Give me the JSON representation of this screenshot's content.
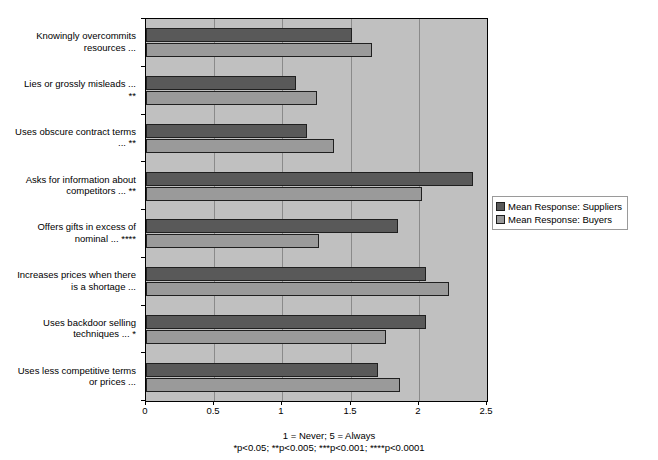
{
  "chart_data": {
    "type": "bar",
    "orientation": "horizontal",
    "title": "",
    "xlabel": "",
    "ylabel": "",
    "xlim": [
      0,
      2.5
    ],
    "xticks": [
      "0",
      "0.5",
      "1",
      "1.5",
      "2",
      "2.5"
    ],
    "xtick_values": [
      0,
      0.5,
      1,
      1.5,
      2,
      2.5
    ],
    "grid": true,
    "legend_position": "right",
    "categories": [
      "Knowingly overcommits resources ...",
      "Lies or grossly misleads ... **",
      "Uses obscure contract terms ... **",
      "Asks for information about competitors ... **",
      "Offers gifts in excess of nominal ... ****",
      "Increases prices when there is a shortage ...",
      "Uses backdoor selling techniques ... *",
      "Uses less competitive terms or prices ..."
    ],
    "category_lines": [
      [
        "Knowingly overcommits",
        "resources ..."
      ],
      [
        "Lies or grossly misleads ...",
        "**"
      ],
      [
        "Uses obscure contract terms",
        "... **"
      ],
      [
        "Asks for information about",
        "competitors ... **"
      ],
      [
        "Offers gifts in excess of",
        "nominal ... ****"
      ],
      [
        "Increases prices when there",
        "is a shortage ..."
      ],
      [
        "Uses backdoor selling",
        "techniques ... *"
      ],
      [
        "Uses less competitive terms",
        "or prices ..."
      ]
    ],
    "series": [
      {
        "name": "Mean Response: Suppliers",
        "color": "#595959",
        "values": [
          1.51,
          1.1,
          1.18,
          2.4,
          1.85,
          2.05,
          2.05,
          1.7
        ]
      },
      {
        "name": "Mean Response: Buyers",
        "color": "#9a9a9a",
        "values": [
          1.66,
          1.25,
          1.38,
          2.02,
          1.27,
          2.22,
          1.76,
          1.86
        ]
      }
    ],
    "footnotes": [
      "1 = Never; 5 = Always",
      "*p<0.05; **p<0.005; ***p<0.001; ****p<0.0001"
    ]
  },
  "legend": {
    "items": [
      {
        "label": "Mean Response: Suppliers"
      },
      {
        "label": "Mean Response: Buyers"
      }
    ]
  },
  "colors": {
    "suppliers": "#595959",
    "buyers": "#9a9a9a",
    "plot_background": "#c0c0c0",
    "gridline": "#8a8a8a",
    "axis": "#000000"
  }
}
